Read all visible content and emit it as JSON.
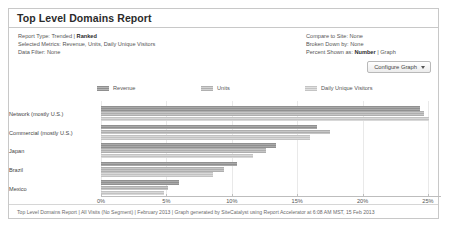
{
  "report": {
    "title": "Top Level Domains Report",
    "meta_left": [
      {
        "label": "Report Type:",
        "value": "Trended | ",
        "emphasis": "Ranked"
      },
      {
        "label": "Selected Metrics:",
        "value": "Revenue, Units, Daily Unique Visitors",
        "emphasis": ""
      },
      {
        "label": "Data Filter:",
        "value": "None",
        "emphasis": ""
      }
    ],
    "meta_right": [
      {
        "label": "Compare to Site:",
        "value": "None",
        "emphasis": ""
      },
      {
        "label": "Broken Down by:",
        "value": "None",
        "emphasis": ""
      },
      {
        "label": "Percent Shown as:",
        "value": " | Graph",
        "emphasis": "Number"
      }
    ],
    "configure_button": "Configure Graph",
    "footer": "Top Level Domains Report | All Visits (No Segment) | February 2013 | Graph generated by SiteCatalyst using Report Accelerator at 6:08 AM MST, 15 Feb 2013"
  },
  "colors": {
    "revenue": "#909090",
    "units": "#aeaeae",
    "visitors": "#c2c2c2",
    "border": "#c8c8c8",
    "grid": "#e9e9e9"
  },
  "chart_data": {
    "type": "bar",
    "orientation": "horizontal",
    "title": "Top Level Domains Report",
    "xlabel": "",
    "ylabel": "",
    "xlim": [
      0,
      26
    ],
    "xticks": [
      0,
      5,
      10,
      15,
      20,
      25
    ],
    "xticklabels": [
      "0%",
      "5%",
      "10%",
      "15%",
      "20%",
      "25%"
    ],
    "grid": true,
    "legend_position": "top",
    "categories": [
      "Network (mostly U.S.)",
      "Commercial (mostly U.S.)",
      "Japan",
      "Brazil",
      "Mexico"
    ],
    "series": [
      {
        "name": "Revenue",
        "values": [
          24.4,
          16.5,
          13.4,
          10.4,
          6.0
        ]
      },
      {
        "name": "Units",
        "values": [
          24.7,
          17.5,
          12.6,
          9.4,
          5.1
        ]
      },
      {
        "name": "Daily Unique Visitors",
        "values": [
          25.1,
          16.0,
          11.6,
          8.6,
          4.8
        ]
      }
    ]
  }
}
